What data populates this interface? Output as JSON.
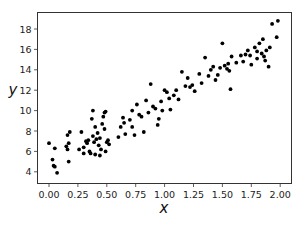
{
  "chart_data": {
    "type": "scatter",
    "title": "",
    "xlabel": "x",
    "ylabel": "y",
    "xlim": [
      -0.1,
      2.1
    ],
    "ylim": [
      3.3,
      19.2
    ],
    "grid": false,
    "legend": null,
    "xticks": [
      "0.00",
      "0.25",
      "0.50",
      "0.75",
      "1.00",
      "1.25",
      "1.50",
      "1.75",
      "2.00"
    ],
    "xtick_values": [
      0,
      0.25,
      0.5,
      0.75,
      1.0,
      1.25,
      1.5,
      1.75,
      2.0
    ],
    "yticks": [
      "4",
      "6",
      "8",
      "10",
      "12",
      "14",
      "16",
      "18"
    ],
    "ytick_values": [
      4,
      6,
      8,
      10,
      12,
      14,
      16,
      18
    ],
    "marker_color": "#000000",
    "series": [
      {
        "name": "data",
        "points": [
          [
            0.0,
            6.8
          ],
          [
            0.04,
            4.6
          ],
          [
            0.03,
            5.2
          ],
          [
            0.05,
            4.5
          ],
          [
            0.07,
            3.9
          ],
          [
            0.05,
            6.3
          ],
          [
            0.16,
            6.2
          ],
          [
            0.15,
            6.5
          ],
          [
            0.16,
            7.6
          ],
          [
            0.18,
            7.9
          ],
          [
            0.17,
            6.8
          ],
          [
            0.17,
            5.0
          ],
          [
            0.26,
            6.2
          ],
          [
            0.28,
            7.9
          ],
          [
            0.3,
            5.8
          ],
          [
            0.3,
            6.4
          ],
          [
            0.32,
            7.0
          ],
          [
            0.33,
            6.8
          ],
          [
            0.34,
            7.1
          ],
          [
            0.35,
            6.0
          ],
          [
            0.36,
            5.8
          ],
          [
            0.37,
            9.2
          ],
          [
            0.38,
            7.5
          ],
          [
            0.38,
            10.0
          ],
          [
            0.39,
            6.9
          ],
          [
            0.4,
            8.4
          ],
          [
            0.4,
            5.7
          ],
          [
            0.41,
            7.2
          ],
          [
            0.42,
            7.8
          ],
          [
            0.43,
            6.6
          ],
          [
            0.44,
            7.3
          ],
          [
            0.45,
            6.2
          ],
          [
            0.46,
            8.7
          ],
          [
            0.47,
            9.4
          ],
          [
            0.48,
            9.8
          ],
          [
            0.49,
            9.9
          ],
          [
            0.48,
            8.2
          ],
          [
            0.5,
            6.9
          ],
          [
            0.51,
            7.1
          ],
          [
            0.52,
            6.7
          ],
          [
            0.49,
            6.0
          ],
          [
            0.44,
            5.6
          ],
          [
            0.6,
            7.4
          ],
          [
            0.62,
            8.4
          ],
          [
            0.64,
            9.3
          ],
          [
            0.65,
            8.8
          ],
          [
            0.66,
            7.7
          ],
          [
            0.7,
            9.1
          ],
          [
            0.72,
            10.0
          ],
          [
            0.72,
            8.4
          ],
          [
            0.74,
            7.6
          ],
          [
            0.76,
            10.6
          ],
          [
            0.78,
            9.6
          ],
          [
            0.8,
            9.4
          ],
          [
            0.82,
            7.9
          ],
          [
            0.84,
            11.0
          ],
          [
            0.86,
            9.8
          ],
          [
            0.88,
            12.6
          ],
          [
            0.9,
            10.4
          ],
          [
            0.92,
            10.2
          ],
          [
            0.94,
            8.6
          ],
          [
            0.95,
            9.2
          ],
          [
            0.97,
            10.9
          ],
          [
            0.98,
            10.0
          ],
          [
            1.0,
            12.0
          ],
          [
            1.02,
            11.8
          ],
          [
            1.04,
            11.2
          ],
          [
            1.05,
            10.1
          ],
          [
            1.08,
            11.5
          ],
          [
            1.1,
            12.0
          ],
          [
            1.12,
            11.1
          ],
          [
            1.15,
            13.8
          ],
          [
            1.18,
            12.4
          ],
          [
            1.2,
            13.2
          ],
          [
            1.22,
            12.3
          ],
          [
            1.24,
            12.5
          ],
          [
            1.26,
            11.9
          ],
          [
            1.3,
            13.6
          ],
          [
            1.32,
            12.7
          ],
          [
            1.35,
            15.2
          ],
          [
            1.38,
            13.4
          ],
          [
            1.4,
            14.0
          ],
          [
            1.42,
            14.3
          ],
          [
            1.44,
            13.0
          ],
          [
            1.46,
            13.5
          ],
          [
            1.48,
            14.2
          ],
          [
            1.5,
            16.6
          ],
          [
            1.52,
            14.4
          ],
          [
            1.54,
            14.1
          ],
          [
            1.55,
            14.6
          ],
          [
            1.56,
            13.9
          ],
          [
            1.57,
            12.1
          ],
          [
            1.58,
            15.3
          ],
          [
            1.62,
            14.7
          ],
          [
            1.66,
            15.4
          ],
          [
            1.68,
            14.8
          ],
          [
            1.72,
            15.9
          ],
          [
            1.75,
            14.5
          ],
          [
            1.78,
            16.2
          ],
          [
            1.8,
            15.1
          ],
          [
            1.82,
            16.6
          ],
          [
            1.84,
            15.6
          ],
          [
            1.86,
            15.3
          ],
          [
            1.87,
            14.9
          ],
          [
            1.88,
            15.9
          ],
          [
            1.9,
            14.3
          ],
          [
            1.91,
            16.2
          ],
          [
            1.93,
            18.5
          ],
          [
            1.98,
            18.8
          ],
          [
            1.97,
            17.2
          ],
          [
            1.85,
            17.0
          ],
          [
            1.8,
            15.8
          ],
          [
            1.74,
            15.4
          ],
          [
            1.7,
            15.5
          ]
        ]
      }
    ]
  }
}
